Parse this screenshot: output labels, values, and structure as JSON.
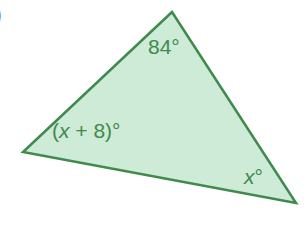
{
  "figure": {
    "type": "triangle",
    "part_label": ")",
    "vertices": {
      "top": {
        "x": 172,
        "y": 12
      },
      "left": {
        "x": 23,
        "y": 152
      },
      "right": {
        "x": 296,
        "y": 203
      }
    },
    "angles": {
      "top": {
        "text": "84°"
      },
      "left": {
        "var": "x",
        "prefix": "(",
        "suffix": " + 8)°"
      },
      "right": {
        "var": "x",
        "suffix": "°"
      }
    },
    "colors": {
      "fill": "#cdebd7",
      "stroke": "#3f8a4c",
      "label": "#3f8a4c",
      "part_label": "#4a7fc1"
    }
  }
}
